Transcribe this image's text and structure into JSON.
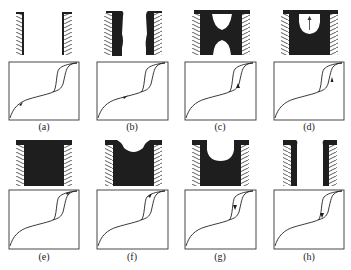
{
  "figure": {
    "panels": [
      {
        "id": "a",
        "label": "(a)",
        "stage": "empty pore",
        "arrow_on_curve": "adsorption-low"
      },
      {
        "id": "b",
        "label": "(b)",
        "stage": "multilayer film",
        "arrow_on_curve": "adsorption-mid"
      },
      {
        "id": "c",
        "label": "(c)",
        "stage": "film bridging / neck",
        "arrow_on_curve": "adsorption-step"
      },
      {
        "id": "d",
        "label": "(d)",
        "stage": "meniscus rising",
        "arrow_on_curve": "adsorption-step-upper"
      },
      {
        "id": "e",
        "label": "(e)",
        "stage": "pore filled",
        "arrow_on_curve": "plateau"
      },
      {
        "id": "f",
        "label": "(f)",
        "stage": "meniscus receding",
        "arrow_on_curve": "desorption-top"
      },
      {
        "id": "g",
        "label": "(g)",
        "stage": "meniscus deeper",
        "arrow_on_curve": "desorption-step"
      },
      {
        "id": "h",
        "label": "(h)",
        "stage": "film remaining",
        "arrow_on_curve": "desorption-bottom"
      }
    ]
  },
  "colors": {
    "ink": "#1e1e1e",
    "background": "#ffffff"
  }
}
